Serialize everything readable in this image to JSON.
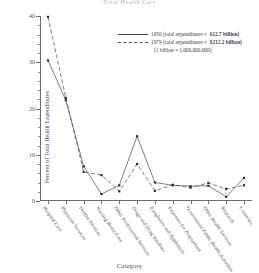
{
  "chart_data": {
    "type": "line",
    "title": "Total Health Care",
    "xlabel": "Category",
    "ylabel": "Percent of Total Health Expenditures",
    "ylim": [
      0,
      40
    ],
    "yticks": [
      0,
      10,
      20,
      30,
      40
    ],
    "ytick_labels": [
      "0",
      "10",
      "20",
      "30",
      "40"
    ],
    "grid": false,
    "legend_position": "upper right",
    "categories": [
      "Hospital Care",
      "Physician Services",
      "Dentist Services",
      "Nursing Home Care",
      "Other Professional Services",
      "Drugs and Drug Sundries",
      "Eyeglasses and Appliances",
      "Expenses for Prepayment",
      "Government Public Health Activities",
      "Other Health Services",
      "Research",
      "Construction"
    ],
    "series": [
      {
        "name": "1950",
        "style": "solid",
        "color": "#4a4a4a",
        "total_expenditures": "$12.7 billion",
        "values": [
          30.4,
          21.8,
          7.5,
          1.5,
          3.4,
          14.0,
          4.0,
          3.4,
          3.2,
          3.3,
          0.9,
          5.0
        ]
      },
      {
        "name": "1979",
        "style": "dashed",
        "color": "#4a4a4a",
        "total_expenditures": "$212.2 billion",
        "values": [
          39.8,
          22.3,
          6.3,
          5.6,
          2.1,
          8.0,
          2.2,
          3.5,
          2.9,
          3.9,
          2.6,
          3.4
        ]
      }
    ],
    "annotations": [
      "(1 billion = 1,000,000,000)"
    ]
  },
  "legend": {
    "entries": [
      {
        "prefix": "1950 (total expenditures =",
        "value": "$12.7 billion)",
        "style": "solid"
      },
      {
        "prefix": "1979 (total expenditures =",
        "value": "$212.2 billion)",
        "style": "dashed"
      }
    ],
    "note": "(1 billion = 1,000,000,000)"
  }
}
